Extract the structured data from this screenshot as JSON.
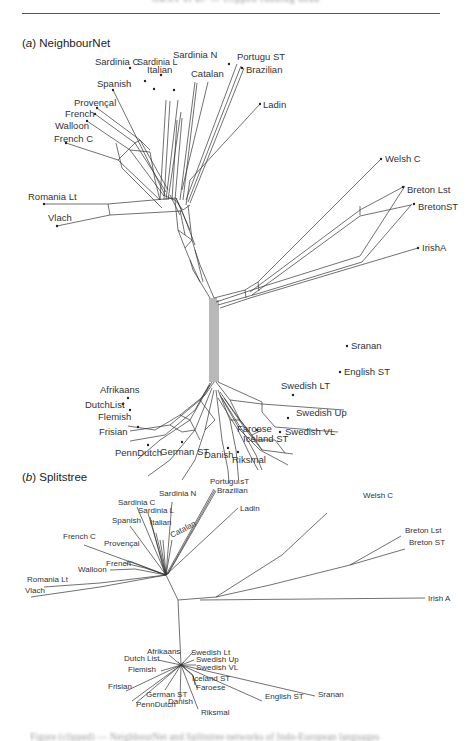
{
  "running_head": "GRAY et al. — clipped running head",
  "panels": [
    {
      "letter": "a",
      "title": "NeighbourNet"
    },
    {
      "letter": "b",
      "title": "Splitstree"
    }
  ],
  "neighbournet": {
    "labels": {
      "sardinia_c": "Sardinia C",
      "sardinia_l": "Sardinia L",
      "sardinia_n": "Sardinia N",
      "italian": "Italian",
      "catalan": "Catalan",
      "portugu_st": "Portugu ST",
      "brazilian": "Brazilian",
      "spanish": "Spanish",
      "provencal": "Provençal",
      "french": "French",
      "walloon": "Walloon",
      "french_c": "French C",
      "ladin": "Ladin",
      "welsh_c": "Welsh C",
      "breton_lst": "Breton Lst",
      "breton_st": "BretonST",
      "irish_a": "IrishA",
      "romania_lt": "Romania Lt",
      "vlach": "Vlach",
      "sranan": "Sranan",
      "english_st": "English ST",
      "afrikaans": "Afrikaans",
      "dutch_list": "DutchList",
      "flemish": "Flemish",
      "frisian": "Frisian",
      "penn_dutch": "PennDutch",
      "german_st": "German ST",
      "danish": "Danish",
      "riksmal": "Riksmal",
      "swedish_lt": "Swedish LT",
      "swedish_up": "Swedish Up",
      "swedish_vl": "Swedish VL",
      "faroese": "Faroese",
      "iceland_st": "Iceland ST"
    }
  },
  "splitstree": {
    "labels": {
      "sardinia_n": "Sardinia N",
      "portugu_st": "Portugu sT",
      "brazilian": "Brazilian",
      "sardinia_c": "Sardinia C",
      "sardinia_l": "Sardinia L",
      "spanish": "Spanish",
      "italian": "Italian",
      "catalan": "Catalan",
      "ladin": "Ladin",
      "french_c": "French C",
      "provencal": "Provençal",
      "french": "French",
      "walloon": "Walloon",
      "romania_lt": "Romania Lt",
      "vlach": "Vlach",
      "welsh_c": "Welsh C",
      "breton_lst": "Breton Lst",
      "breton_st": "Breton ST",
      "irish_a": "Irish A",
      "afrikaans": "Afrikaans",
      "swedish_lt": "Swedish Lt",
      "dutch_list": "Dutch List",
      "swedish_up": "Swedish Up",
      "swedish_vl": "Swedish VL",
      "flemish": "Flemish",
      "iceland_st": "Iceland ST",
      "faroese": "Faroese",
      "frisian": "Frisian",
      "german_st": "German ST",
      "penn_dutch": "PennDutch",
      "danish": "Danish",
      "riksmal": "Riksmal",
      "english_st": "English ST",
      "sranan": "Sranan"
    }
  },
  "caption": "Figure (clipped) — NeighbourNet and Splitstree networks of Indo-European languages"
}
